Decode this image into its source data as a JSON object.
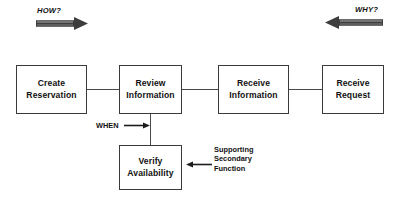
{
  "diagram": {
    "background_color": "#ffffff",
    "line_color": "#4a4a4a",
    "box_border_color": "#3a3a3a",
    "text_color": "#111111",
    "banners": [
      {
        "id": "how",
        "label": "HOW?",
        "direction": "right",
        "icon": "thick-right-arrow-icon"
      },
      {
        "id": "why",
        "label": "WHY?",
        "direction": "left",
        "icon": "thick-left-arrow-icon"
      }
    ],
    "nodes": [
      {
        "id": "create-reservation",
        "line1": "Create",
        "line2": "Reservation"
      },
      {
        "id": "review-information",
        "line1": "Review",
        "line2": "Information"
      },
      {
        "id": "receive-information",
        "line1": "Receive",
        "line2": "Information"
      },
      {
        "id": "receive-request",
        "line1": "Receive",
        "line2": "Request"
      },
      {
        "id": "verify-availability",
        "line1": "Verify",
        "line2": "Availability"
      }
    ],
    "annotations": [
      {
        "id": "when",
        "label": "WHEN",
        "icon": "thin-right-arrow-icon"
      },
      {
        "id": "supporting-secondary-function",
        "line1": "Supporting",
        "line2": "Secondary",
        "line3": "Function",
        "icon": "thin-left-arrow-icon"
      }
    ]
  }
}
